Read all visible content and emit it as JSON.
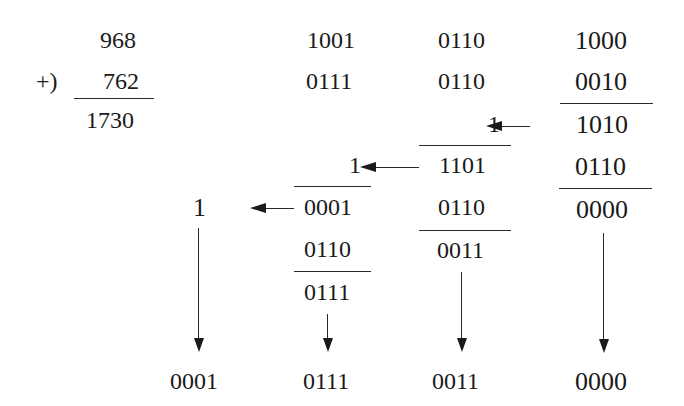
{
  "decimal_addition": {
    "operand1": "968",
    "operator": "+)",
    "operand2": "762",
    "sum": "1730"
  },
  "bcd_columns": {
    "hundreds": {
      "operand1": "1001",
      "operand2": "0111",
      "carry_in": "1",
      "partial_sum": "0001",
      "correction": "0110",
      "corrected": "0111",
      "result": "0111"
    },
    "tens": {
      "operand1": "0110",
      "operand2": "0110",
      "carry_in": "1",
      "partial_sum": "1101",
      "correction": "0110",
      "corrected": "0011",
      "result": "0011"
    },
    "ones": {
      "operand1": "1000",
      "operand2": "0010",
      "partial_sum": "1010",
      "correction": "0110",
      "corrected": "0000",
      "result": "0000"
    },
    "thousands": {
      "carry": "1",
      "result": "0001"
    }
  }
}
